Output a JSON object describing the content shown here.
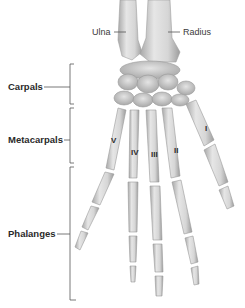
{
  "diagram": {
    "forearm_labels": {
      "ulna": "Ulna",
      "radius": "Radius"
    },
    "group_labels": {
      "carpals": "Carpals",
      "metacarpals": "Metacarpals",
      "phalanges": "Phalanges"
    },
    "metacarpal_numerals": [
      "V",
      "IV",
      "III",
      "II",
      "I"
    ],
    "colors": {
      "bone_fill": "#dcdcdc",
      "bone_shadow": "#9a9a9a",
      "leader_line": "#555555",
      "label_text": "#2a2a2a",
      "background": "#ffffff"
    }
  }
}
